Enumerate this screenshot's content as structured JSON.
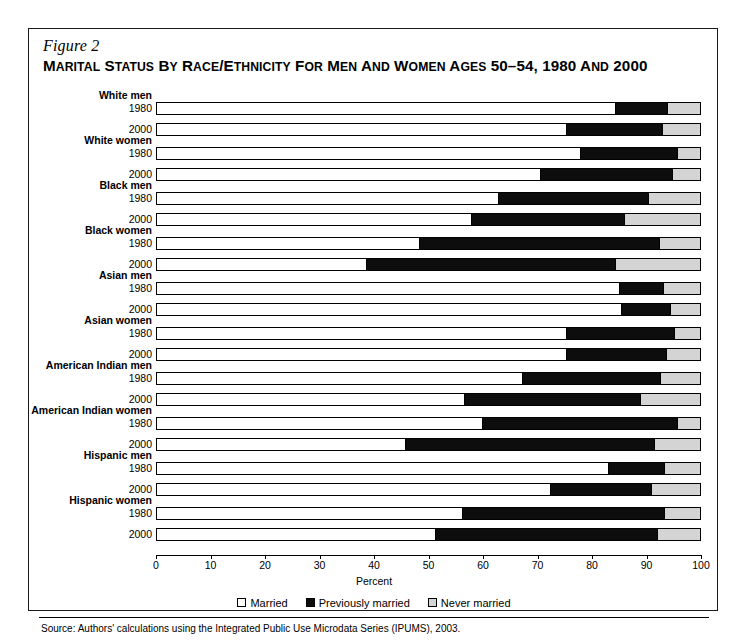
{
  "figure": {
    "number": "Figure 2",
    "title_parts": [
      {
        "t": "M",
        "caps": true
      },
      {
        "t": "ARITAL",
        "caps": false
      },
      {
        "t": " S",
        "caps": true
      },
      {
        "t": "TATUS",
        "caps": false
      },
      {
        "t": " BY ",
        "caps": false
      },
      {
        "t": "R",
        "caps": true
      },
      {
        "t": "ACE",
        "caps": false
      },
      {
        "t": "/E",
        "caps": true
      },
      {
        "t": "THNICITY",
        "caps": false
      },
      {
        "t": " FOR ",
        "caps": false
      },
      {
        "t": "M",
        "caps": true
      },
      {
        "t": "EN",
        "caps": false
      },
      {
        "t": " AND ",
        "caps": false
      },
      {
        "t": "W",
        "caps": true
      },
      {
        "t": "OMEN",
        "caps": false
      },
      {
        "t": " A",
        "caps": true
      },
      {
        "t": "GES",
        "caps": false
      },
      {
        "t": " 50–54, 1980 ",
        "caps": true
      },
      {
        "t": "AND",
        "caps": false
      },
      {
        "t": " 2000",
        "caps": true
      }
    ],
    "title_text": "MARITAL STATUS BY RACE/ETHNICITY FOR MEN AND WOMEN AGES 50–54, 1980 AND 2000",
    "source": "Source: Authors' calculations using the Integrated Public Use Microdata Series (IPUMS), 2003."
  },
  "chart_data": {
    "type": "bar",
    "orientation": "horizontal",
    "stacked": true,
    "title": "MARITAL STATUS BY RACE/ETHNICITY FOR MEN AND WOMEN AGES 50–54, 1980 AND 2000",
    "xlabel": "Percent",
    "ylabel": "",
    "xlim": [
      0,
      100
    ],
    "xticks": [
      0,
      10,
      20,
      30,
      40,
      50,
      60,
      70,
      80,
      90,
      100
    ],
    "xticklabels": [
      "0",
      "10",
      "20",
      "30",
      "40",
      "50",
      "60",
      "70",
      "80",
      "90",
      "100"
    ],
    "grid": false,
    "legend_position": "bottom",
    "series": [
      {
        "name": "Married",
        "color": "#ffffff"
      },
      {
        "name": "Previously married",
        "color": "#0d0d0d"
      },
      {
        "name": "Never married",
        "color": "#d4d4d4"
      }
    ],
    "groups": [
      {
        "label": "White men",
        "rows": [
          {
            "year": "1980",
            "married": 84.0,
            "previously_married": 9.6,
            "never_married": 6.4
          },
          {
            "year": "2000",
            "married": 75.0,
            "previously_married": 17.7,
            "never_married": 7.3
          }
        ]
      },
      {
        "label": "White women",
        "rows": [
          {
            "year": "1980",
            "married": 77.6,
            "previously_married": 17.8,
            "never_married": 4.6
          },
          {
            "year": "2000",
            "married": 70.3,
            "previously_married": 24.2,
            "never_married": 5.5
          }
        ]
      },
      {
        "label": "Black men",
        "rows": [
          {
            "year": "1980",
            "married": 62.6,
            "previously_married": 27.5,
            "never_married": 9.9
          },
          {
            "year": "2000",
            "married": 57.6,
            "previously_married": 28.1,
            "never_married": 14.3
          }
        ]
      },
      {
        "label": "Black women",
        "rows": [
          {
            "year": "1980",
            "married": 48.0,
            "previously_married": 44.1,
            "never_married": 7.9
          },
          {
            "year": "2000",
            "married": 38.3,
            "previously_married": 45.7,
            "never_married": 16.0
          }
        ]
      },
      {
        "label": "Asian men",
        "rows": [
          {
            "year": "1980",
            "married": 84.8,
            "previously_married": 8.0,
            "never_married": 7.2
          },
          {
            "year": "2000",
            "married": 85.1,
            "previously_married": 9.0,
            "never_married": 5.9
          }
        ]
      },
      {
        "label": "Asian women",
        "rows": [
          {
            "year": "1980",
            "married": 75.0,
            "previously_married": 19.8,
            "never_married": 5.2
          },
          {
            "year": "2000",
            "married": 75.0,
            "previously_married": 18.4,
            "never_married": 6.6
          }
        ]
      },
      {
        "label": "American Indian men",
        "rows": [
          {
            "year": "1980",
            "married": 67.0,
            "previously_married": 25.3,
            "never_married": 7.7
          },
          {
            "year": "2000",
            "married": 56.3,
            "previously_married": 32.3,
            "never_married": 11.4
          }
        ]
      },
      {
        "label": "American Indian women",
        "rows": [
          {
            "year": "1980",
            "married": 59.6,
            "previously_married": 35.8,
            "never_married": 4.6
          },
          {
            "year": "2000",
            "married": 45.5,
            "previously_married": 45.7,
            "never_married": 8.8
          }
        ]
      },
      {
        "label": "Hispanic men",
        "rows": [
          {
            "year": "1980",
            "married": 82.8,
            "previously_married": 10.2,
            "never_married": 7.0
          },
          {
            "year": "2000",
            "married": 72.2,
            "previously_married": 18.4,
            "never_married": 9.4
          }
        ]
      },
      {
        "label": "Hispanic women",
        "rows": [
          {
            "year": "1980",
            "married": 56.0,
            "previously_married": 37.0,
            "never_married": 7.0
          },
          {
            "year": "2000",
            "married": 51.0,
            "previously_married": 40.7,
            "never_married": 8.3
          }
        ]
      }
    ]
  }
}
